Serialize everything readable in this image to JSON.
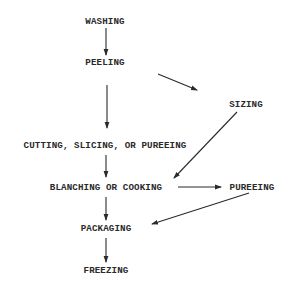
{
  "diagram": {
    "type": "flowchart",
    "colors": {
      "ink": "#2a2a2a",
      "background": "#ffffff"
    },
    "nodes": [
      {
        "id": "washing",
        "label": "WASHING",
        "x": 105,
        "y": 24
      },
      {
        "id": "peeling",
        "label": "PEELING",
        "x": 105,
        "y": 65
      },
      {
        "id": "sizing",
        "label": "SIZING",
        "x": 246,
        "y": 107
      },
      {
        "id": "cutting",
        "label": "CUTTING, SLICING, OR PUREEING",
        "x": 105,
        "y": 148
      },
      {
        "id": "blanching",
        "label": "BLANCHING OR COOKING",
        "x": 106,
        "y": 190
      },
      {
        "id": "pureeing",
        "label": "PUREEING",
        "x": 252,
        "y": 190
      },
      {
        "id": "packaging",
        "label": "PACKAGING",
        "x": 106,
        "y": 231
      },
      {
        "id": "freezing",
        "label": "FREEZING",
        "x": 106,
        "y": 273
      }
    ],
    "edges": [
      {
        "from": "washing",
        "to": "peeling"
      },
      {
        "from": "peeling",
        "to": "cutting"
      },
      {
        "from": "peeling",
        "to": "sizing"
      },
      {
        "from": "sizing",
        "to": "blanching"
      },
      {
        "from": "cutting",
        "to": "blanching"
      },
      {
        "from": "blanching",
        "to": "pureeing"
      },
      {
        "from": "blanching",
        "to": "packaging"
      },
      {
        "from": "pureeing",
        "to": "packaging"
      },
      {
        "from": "packaging",
        "to": "freezing"
      }
    ]
  }
}
